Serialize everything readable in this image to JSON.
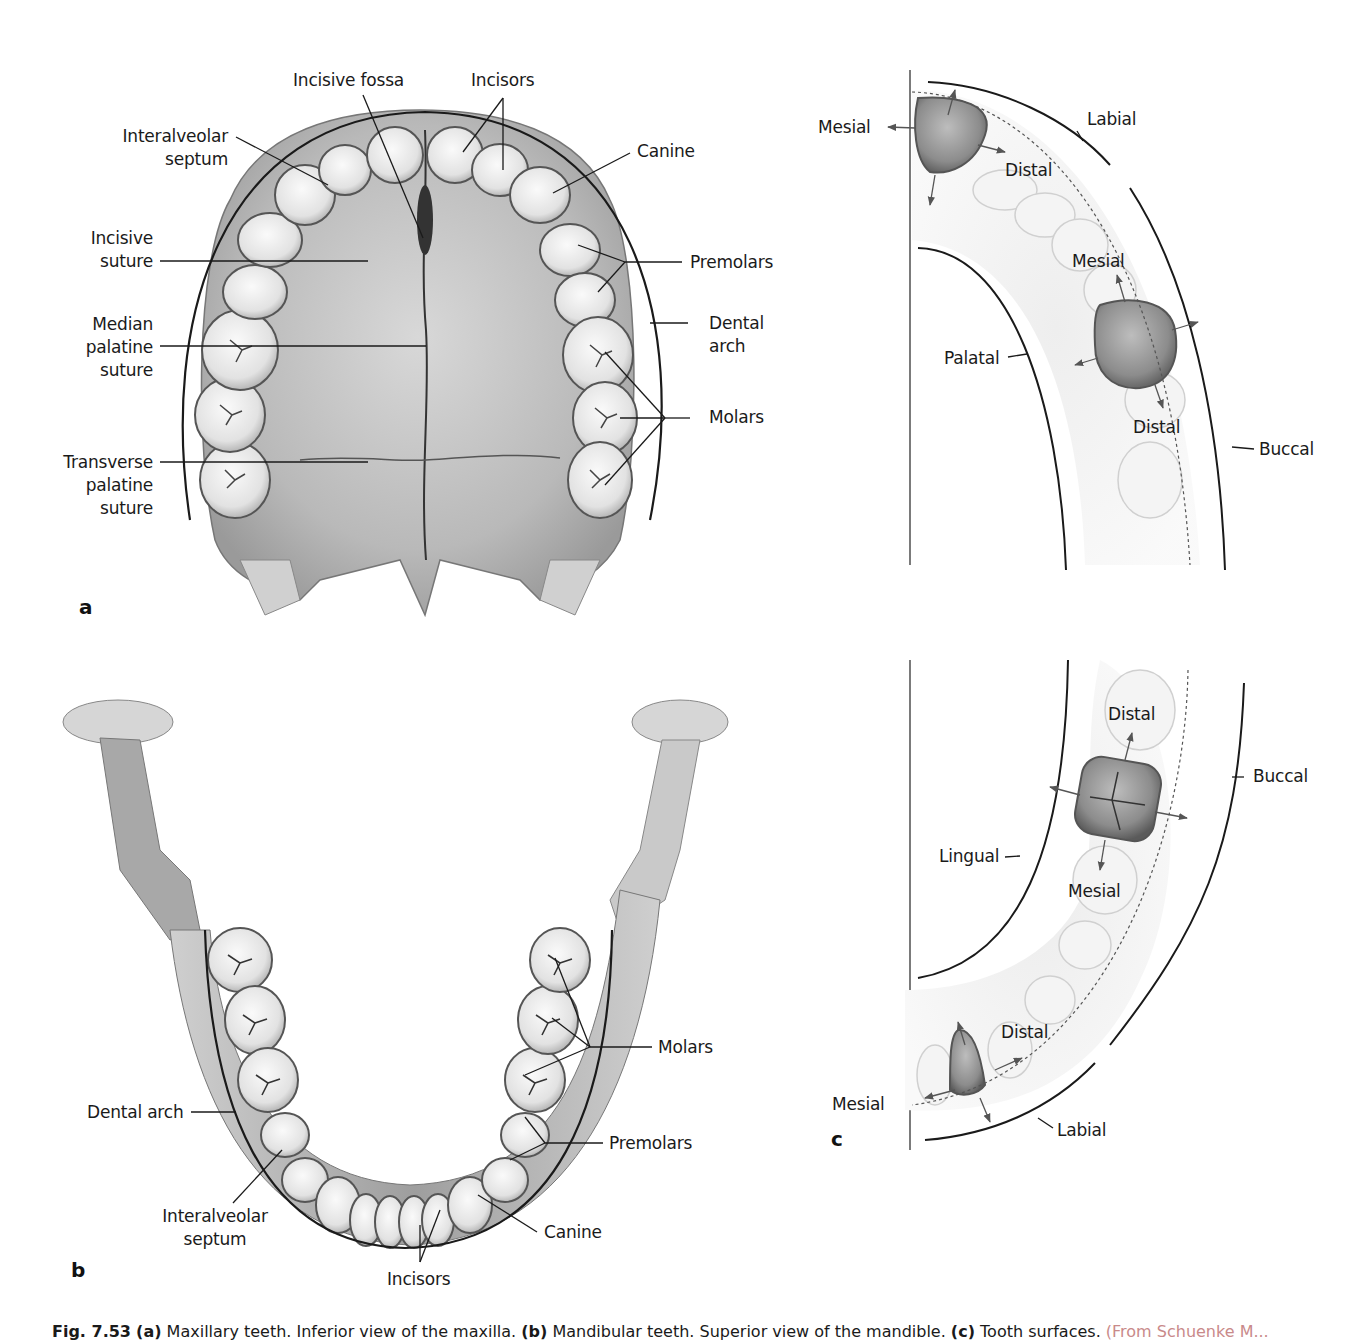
{
  "figure": {
    "panels": {
      "a": {
        "letter": "a",
        "view": "Maxillary teeth, inferior view of the maxilla",
        "labels": {
          "incisive_fossa": "Incisive fossa",
          "incisors": "Incisors",
          "interalveolar_septum_1": "Interalveolar",
          "interalveolar_septum_2": "septum",
          "canine": "Canine",
          "incisive_suture_1": "Incisive",
          "incisive_suture_2": "suture",
          "premolars": "Premolars",
          "median_palatine_1": "Median",
          "median_palatine_2": "palatine",
          "median_palatine_3": "suture",
          "dental_arch_1": "Dental",
          "dental_arch_2": "arch",
          "molars": "Molars",
          "transverse_palatine_1": "Transverse",
          "transverse_palatine_2": "palatine",
          "transverse_palatine_3": "suture"
        }
      },
      "b": {
        "letter": "b",
        "view": "Mandibular teeth, superior view of the mandible",
        "labels": {
          "molars": "Molars",
          "dental_arch": "Dental arch",
          "premolars": "Premolars",
          "interalveolar_septum_1": "Interalveolar",
          "interalveolar_septum_2": "septum",
          "canine": "Canine",
          "incisors": "Incisors"
        }
      },
      "c": {
        "letter": "c",
        "view": "Tooth surfaces",
        "upper": {
          "mesial_incisor": "Mesial",
          "labial": "Labial",
          "distal_incisor": "Distal",
          "mesial_molar": "Mesial",
          "palatal": "Palatal",
          "distal_molar": "Distal",
          "buccal": "Buccal"
        },
        "lower": {
          "distal_molar": "Distal",
          "buccal": "Buccal",
          "lingual": "Lingual",
          "mesial_molar": "Mesial",
          "distal_incisor": "Distal",
          "mesial_incisor": "Mesial",
          "labial": "Labial"
        }
      }
    },
    "caption": {
      "fig_number": "Fig. 7.53",
      "a_tag": "(a)",
      "a_text": " Maxillary teeth. Inferior view of the maxilla. ",
      "b_tag": "(b)",
      "b_text": " Mandibular teeth. Superior view of the mandible. ",
      "c_tag": "(c)",
      "c_text": " Tooth surfaces. ",
      "source": "(From Schuenke M..."
    },
    "colors": {
      "bone_light": "#e6e6e6",
      "bone_mid": "#bdbdbd",
      "bone_dark": "#8a8a8a",
      "tooth": "#f2f2f2",
      "line": "#1a1a1a",
      "arrow": "#555555",
      "caption_source": "#c98a8a"
    }
  }
}
